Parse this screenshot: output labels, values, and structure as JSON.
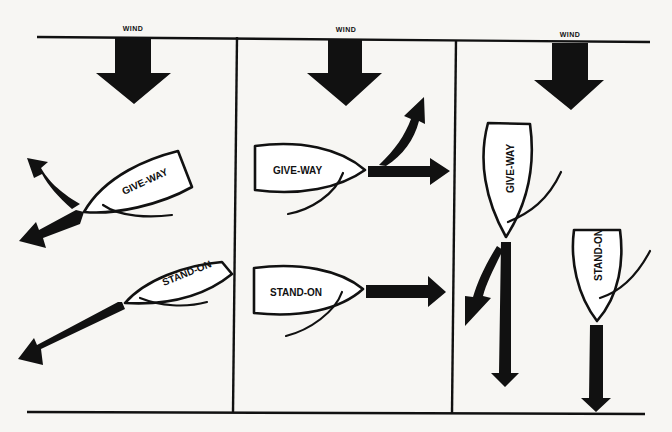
{
  "diagram": {
    "panels": [
      {
        "id": "panel-1",
        "wind_label": "WIND",
        "boats": [
          {
            "label": "GIVE-WAY",
            "role": "give-way"
          },
          {
            "label": "STAND-ON",
            "role": "stand-on"
          }
        ]
      },
      {
        "id": "panel-2",
        "wind_label": "WIND",
        "boats": [
          {
            "label": "GIVE-WAY",
            "role": "give-way"
          },
          {
            "label": "STAND-ON",
            "role": "stand-on"
          }
        ]
      },
      {
        "id": "panel-3",
        "wind_label": "WIND",
        "boats": [
          {
            "label": "GIVE-WAY",
            "role": "give-way"
          },
          {
            "label": "STAND-ON",
            "role": "stand-on"
          }
        ]
      }
    ],
    "colors": {
      "ink": "#111111",
      "paper": "#f7f6f3"
    }
  }
}
